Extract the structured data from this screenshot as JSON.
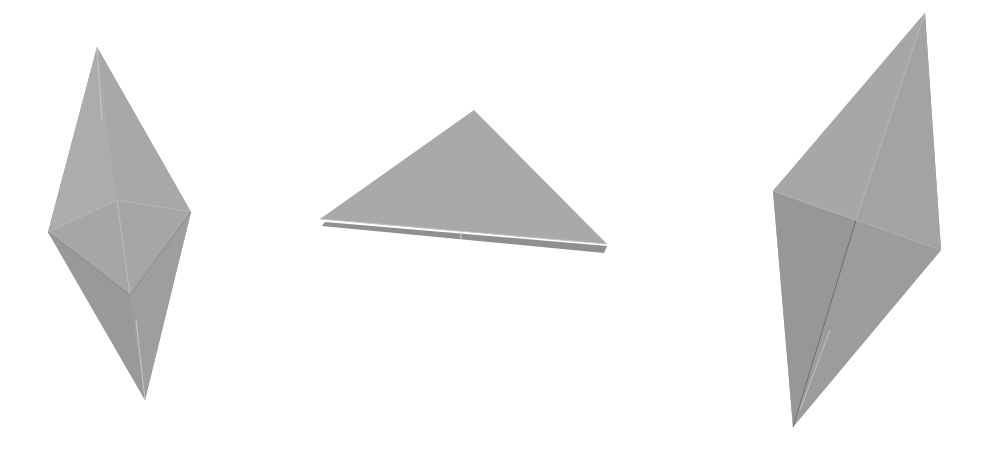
{
  "scene": {
    "description": "Three grey origami paper folds on white background",
    "background": "#ffffff",
    "paper_colors": {
      "light": "#a9a9a9",
      "mid": "#9c9c9c",
      "dark": "#8f8f8f",
      "crease": "#c8c8c8",
      "shadow_line": "#6e6e6e"
    }
  },
  "figures": [
    {
      "name": "left-diamond-fold"
    },
    {
      "name": "middle-triangle-fold"
    },
    {
      "name": "right-diamond-fold"
    }
  ]
}
